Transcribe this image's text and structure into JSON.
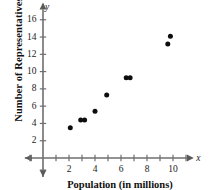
{
  "chart_data": {
    "type": "scatter",
    "title": "",
    "xlabel": "Population (in millions)",
    "ylabel": "Number of Representatives",
    "x_axis_symbol": "x",
    "y_axis_symbol": "y",
    "xlim": [
      -1.4,
      11.6
    ],
    "ylim": [
      -2.2,
      18.0
    ],
    "grid": false,
    "legend": "none",
    "x_ticks_major": [
      2,
      4,
      6,
      8,
      10
    ],
    "x_ticks_minor": [
      1,
      3,
      5,
      7,
      9,
      11
    ],
    "y_ticks_major": [
      2,
      4,
      6,
      8,
      10,
      12,
      14,
      16
    ],
    "x_tick_labels": [
      "2",
      "4",
      "6",
      "8",
      "10"
    ],
    "y_tick_labels": [
      "2",
      "4",
      "6",
      "8",
      "10",
      "12",
      "14",
      "16"
    ],
    "point_color": "#0d0d0d",
    "axis_color": "#6f6f6f",
    "points": [
      {
        "x": 2.1,
        "y": 3.5
      },
      {
        "x": 2.9,
        "y": 4.4
      },
      {
        "x": 3.2,
        "y": 4.4
      },
      {
        "x": 4.0,
        "y": 5.4
      },
      {
        "x": 4.9,
        "y": 7.3
      },
      {
        "x": 6.4,
        "y": 9.3
      },
      {
        "x": 6.7,
        "y": 9.3
      },
      {
        "x": 9.6,
        "y": 13.2
      },
      {
        "x": 9.8,
        "y": 14.1
      }
    ]
  }
}
